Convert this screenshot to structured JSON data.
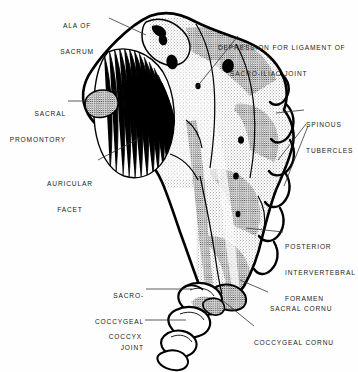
{
  "figure": {
    "view": "lateral",
    "style": "black-and-white stipple and line engraving",
    "background_color": "#fefefe",
    "ink_color": "#000000"
  },
  "labels": [
    {
      "id": "ala-of-sacrum",
      "lines": [
        "ALA OF",
        "SACRUM"
      ],
      "align": "center",
      "x": 72,
      "y": 5
    },
    {
      "id": "depression-for-ligament",
      "lines": [
        "DEPRESSION FOR LIGAMENT OF",
        "SACRO-ILIAC JOINT"
      ],
      "align": "left",
      "x": 218,
      "y": 27
    },
    {
      "id": "sacral-promontory",
      "lines": [
        "SACRAL",
        "PROMONTORY"
      ],
      "align": "right",
      "x": 6,
      "y": 93
    },
    {
      "id": "spinous-tubercles",
      "lines": [
        "SPINOUS",
        "TUBERCLES"
      ],
      "align": "left",
      "x": 306,
      "y": 104
    },
    {
      "id": "auricular-facet",
      "lines": [
        "AURICULAR",
        "FACET"
      ],
      "align": "center",
      "x": 44,
      "y": 163
    },
    {
      "id": "posterior-intervertebral-foramen",
      "lines": [
        "POSTERIOR",
        "INTERVERTEBRAL",
        "FORAMEN"
      ],
      "align": "left",
      "x": 285,
      "y": 227
    },
    {
      "id": "sacro-coccygeal-joint",
      "lines": [
        "SACRO-",
        "COCCYGEAL",
        "JOINT"
      ],
      "align": "right",
      "x": 98,
      "y": 275
    },
    {
      "id": "sacral-cornu",
      "lines": [
        "SACRAL CORNU"
      ],
      "align": "left",
      "x": 270,
      "y": 288
    },
    {
      "id": "coccyx",
      "lines": [
        "COCCYX"
      ],
      "align": "right",
      "x": 102,
      "y": 316
    },
    {
      "id": "coccygeal-cornu",
      "lines": [
        "COCCYGEAL CORNU"
      ],
      "align": "left",
      "x": 256,
      "y": 323
    }
  ]
}
